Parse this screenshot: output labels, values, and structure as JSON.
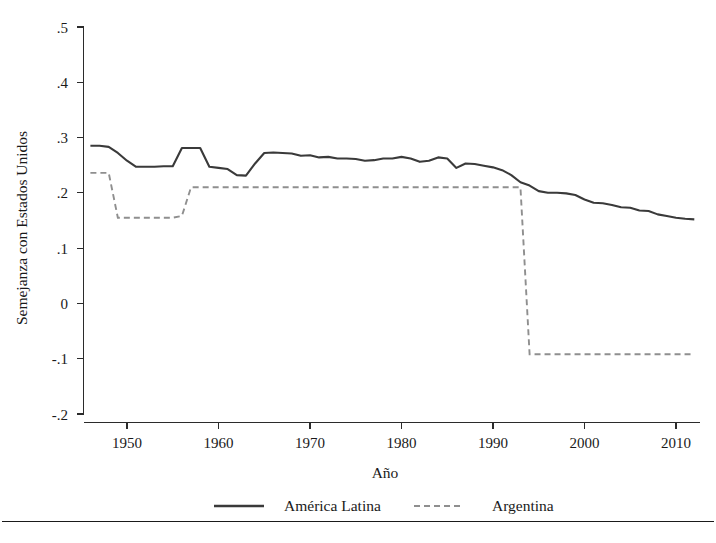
{
  "chart_data": {
    "type": "line",
    "title": "",
    "xlabel": "Año",
    "ylabel": "Semejanza con Estados Unidos",
    "xlim": [
      1946,
      2012
    ],
    "ylim": [
      -0.2,
      0.5
    ],
    "grid": false,
    "legend_position": "bottom",
    "xticks": [
      1950,
      1960,
      1970,
      1980,
      1990,
      2000,
      2010
    ],
    "xtick_labels": [
      "1950",
      "1960",
      "1970",
      "1980",
      "1990",
      "2000",
      "2010"
    ],
    "yticks": [
      -0.2,
      -0.1,
      0,
      0.1,
      0.2,
      0.3,
      0.4,
      0.5
    ],
    "ytick_labels": [
      "-.2",
      "-.1",
      "0",
      ".1",
      ".2",
      ".3",
      ".4",
      ".5"
    ],
    "x": [
      1946,
      1947,
      1948,
      1949,
      1950,
      1951,
      1952,
      1953,
      1954,
      1955,
      1956,
      1957,
      1958,
      1959,
      1960,
      1961,
      1962,
      1963,
      1964,
      1965,
      1966,
      1967,
      1968,
      1969,
      1970,
      1971,
      1972,
      1973,
      1974,
      1975,
      1976,
      1977,
      1978,
      1979,
      1980,
      1981,
      1982,
      1983,
      1984,
      1985,
      1986,
      1987,
      1988,
      1989,
      1990,
      1991,
      1992,
      1993,
      1994,
      1995,
      1996,
      1997,
      1998,
      1999,
      2000,
      2001,
      2002,
      2003,
      2004,
      2005,
      2006,
      2007,
      2008,
      2009,
      2010,
      2011,
      2012
    ],
    "series": [
      {
        "name": "América Latina",
        "style": "solid",
        "color": "#3a3a3a",
        "values": [
          0.285,
          0.285,
          0.283,
          0.272,
          0.258,
          0.247,
          0.247,
          0.247,
          0.248,
          0.248,
          0.281,
          0.281,
          0.281,
          0.247,
          0.245,
          0.243,
          0.232,
          0.231,
          0.253,
          0.272,
          0.273,
          0.272,
          0.271,
          0.267,
          0.268,
          0.264,
          0.265,
          0.262,
          0.262,
          0.261,
          0.258,
          0.259,
          0.262,
          0.262,
          0.265,
          0.262,
          0.256,
          0.258,
          0.264,
          0.262,
          0.245,
          0.253,
          0.252,
          0.249,
          0.246,
          0.241,
          0.232,
          0.219,
          0.213,
          0.203,
          0.2,
          0.2,
          0.199,
          0.196,
          0.188,
          0.182,
          0.181,
          0.178,
          0.174,
          0.173,
          0.168,
          0.167,
          0.161,
          0.158,
          0.155,
          0.153,
          0.152
        ]
      },
      {
        "name": "Argentina",
        "style": "dashed",
        "color": "#8f8f8f",
        "values": [
          0.236,
          0.236,
          0.236,
          0.155,
          0.155,
          0.155,
          0.155,
          0.155,
          0.155,
          0.155,
          0.158,
          0.21,
          0.21,
          0.21,
          0.21,
          0.21,
          0.21,
          0.21,
          0.21,
          0.21,
          0.21,
          0.21,
          0.21,
          0.21,
          0.21,
          0.21,
          0.21,
          0.21,
          0.21,
          0.21,
          0.21,
          0.21,
          0.21,
          0.21,
          0.21,
          0.21,
          0.21,
          0.21,
          0.21,
          0.21,
          0.21,
          0.21,
          0.21,
          0.21,
          0.21,
          0.21,
          0.21,
          0.21,
          -0.092,
          -0.092,
          -0.092,
          -0.092,
          -0.092,
          -0.092,
          -0.092,
          -0.092,
          -0.092,
          -0.092,
          -0.092,
          -0.092,
          -0.092,
          -0.092,
          -0.092,
          -0.092,
          -0.092,
          -0.092,
          -0.092
        ]
      }
    ],
    "legend": [
      {
        "label": "América Latina",
        "style": "solid"
      },
      {
        "label": "Argentina",
        "style": "dashed"
      }
    ]
  }
}
